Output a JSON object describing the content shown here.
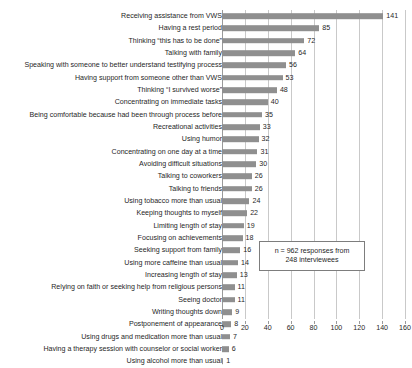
{
  "chart_data": {
    "type": "bar",
    "orientation": "horizontal",
    "title": "",
    "xlabel": "",
    "ylabel": "",
    "xlim": [
      0,
      160
    ],
    "xticks": [
      0,
      20,
      40,
      60,
      80,
      100,
      120,
      140,
      160
    ],
    "grid": true,
    "legend": "none",
    "bar_color": "#8f8f8f",
    "annotation": {
      "line1": "n = 962 responses from",
      "line2": "248 interviewees"
    },
    "categories": [
      "Receiving assistance from VWS",
      "Having a rest period",
      "Thinking “this has to be done”",
      "Talking with family",
      "Speaking with someone to better understand testifying process",
      "Having support from someone other than VWS",
      "Thinking “I survived worse”",
      "Concentrating on immediate tasks",
      "Being comfortable because had been through process before",
      "Recreational activities",
      "Using humor",
      "Concentrating on one day at a time",
      "Avoiding difficult situations",
      "Talking to coworkers",
      "Talking to friends",
      "Using tobacco more than usual",
      "Keeping thoughts to myself",
      "Limiting length of stay",
      "Focusing on achievements",
      "Seeking support from family",
      "Using more caffeine than usual",
      "Increasing length of stay",
      "Relying on faith or seeking help from religious persons",
      "Seeing doctor",
      "Writing thoughts down",
      "Postponement of appearance",
      "Using drugs and medication more than usual",
      "Having a therapy session with counselor or social worker",
      "Using alcohol more than usual"
    ],
    "values": [
      141,
      85,
      72,
      64,
      56,
      53,
      48,
      40,
      35,
      33,
      32,
      31,
      30,
      26,
      26,
      24,
      22,
      19,
      18,
      16,
      14,
      13,
      11,
      11,
      9,
      8,
      7,
      6,
      1
    ]
  }
}
